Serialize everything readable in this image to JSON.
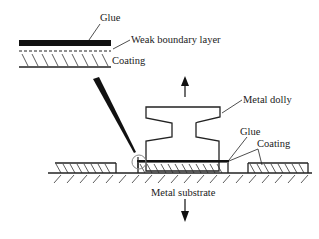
{
  "diagram": {
    "labels": {
      "inset_glue": "Glue",
      "inset_weak_boundary": "Weak boundary layer",
      "inset_coating": "Coating",
      "metal_dolly": "Metal dolly",
      "glue": "Glue",
      "coating": "Coating",
      "metal_substrate": "Metal substrate"
    },
    "arrows": {
      "up": "pull-up-force",
      "down": "pull-down-force"
    },
    "colors": {
      "ink": "#222222",
      "background": "#ffffff",
      "detail_circle": "#888888"
    }
  }
}
